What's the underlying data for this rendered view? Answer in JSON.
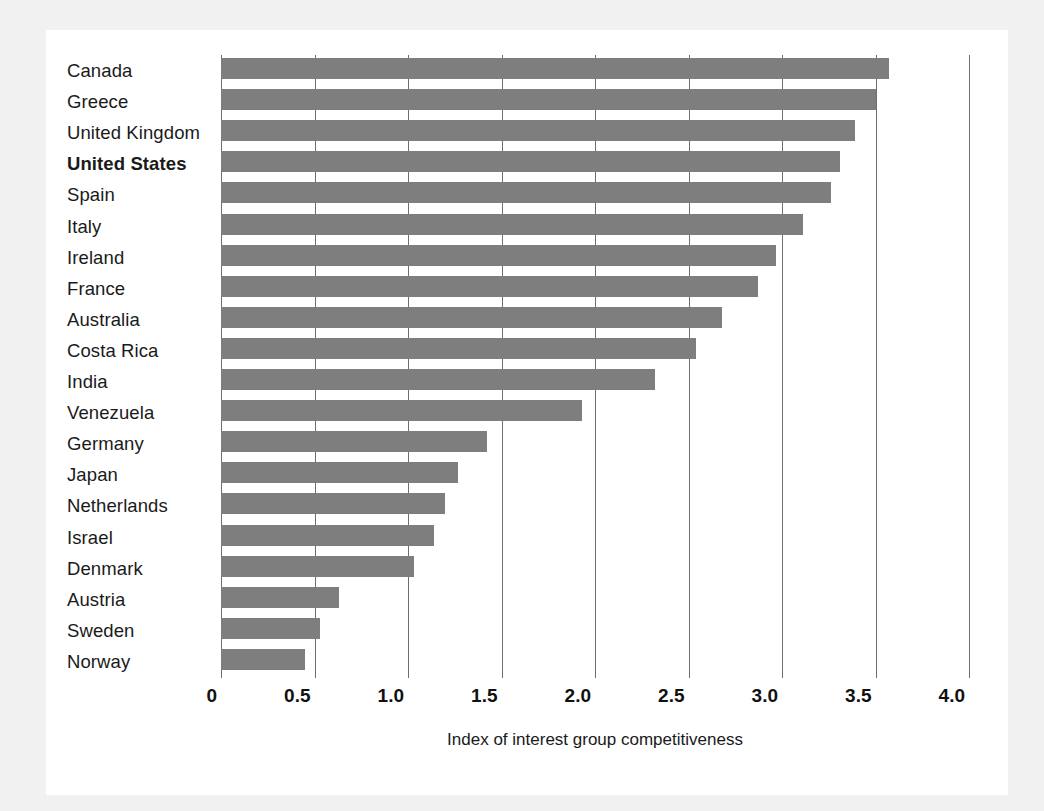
{
  "chart_data": {
    "type": "bar",
    "orientation": "horizontal",
    "title": "",
    "xlabel": "Index of interest group competitiveness",
    "ylabel": "",
    "xlim": [
      0,
      4.0
    ],
    "xticks": [
      "0",
      "0.5",
      "1.0",
      "1.5",
      "2.0",
      "2.5",
      "3.0",
      "3.5",
      "4.0"
    ],
    "xtick_values": [
      0,
      0.5,
      1.0,
      1.5,
      2.0,
      2.5,
      3.0,
      3.5,
      4.0
    ],
    "grid": true,
    "legend": "none",
    "highlight_category": "United States",
    "bar_color": "#7e7e7e",
    "gridline_color": "#6e6e6e",
    "categories": [
      "Canada",
      "Greece",
      "United Kingdom",
      "United States",
      "Spain",
      "Italy",
      "Ireland",
      "France",
      "Australia",
      "Costa Rica",
      "India",
      "Venezuela",
      "Germany",
      "Japan",
      "Netherlands",
      "Israel",
      "Denmark",
      "Austria",
      "Sweden",
      "Norway"
    ],
    "values": [
      3.57,
      3.5,
      3.39,
      3.31,
      3.26,
      3.11,
      2.97,
      2.87,
      2.68,
      2.54,
      2.32,
      1.93,
      1.42,
      1.27,
      1.2,
      1.14,
      1.03,
      0.63,
      0.53,
      0.45
    ]
  },
  "page": {
    "background": "#f1f1f1",
    "card_background": "#ffffff"
  }
}
